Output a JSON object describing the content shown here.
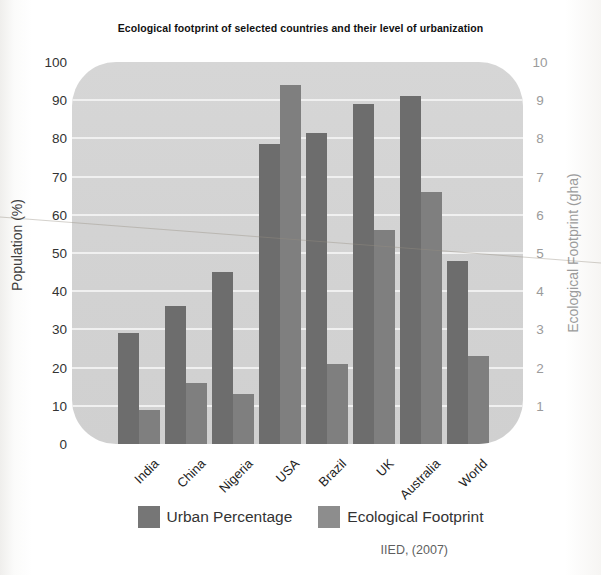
{
  "title": "Ecological  footprint of selected countries and their level of urbanization",
  "source": "IIED, (2007)",
  "left_axis": {
    "label": "Population (%)",
    "ticks": [
      0,
      10,
      20,
      30,
      40,
      50,
      60,
      70,
      80,
      90,
      100
    ],
    "min": 0,
    "max": 100
  },
  "right_axis": {
    "label": "Ecological Footprint (gha)",
    "ticks": [
      1,
      2,
      3,
      4,
      5,
      6,
      7,
      8,
      9,
      10
    ],
    "min": 0,
    "max": 10
  },
  "legend": [
    {
      "label": "Urban Percentage",
      "color": "#767676"
    },
    {
      "label": "Ecological Footprint",
      "color": "#8d8d8d"
    }
  ],
  "colors": {
    "urban_bar": "#6d6d6d",
    "footprint_bar": "#7f7f7f",
    "plot_background": "#d3d3d3",
    "gridline": "#f0f0f0",
    "left_axis_text": "#333333",
    "right_axis_text": "#9b9b9b"
  },
  "chart_data": {
    "type": "bar",
    "title": "Ecological footprint of selected countries and their level of urbanization",
    "categories": [
      "India",
      "China",
      "Nigeria",
      "USA",
      "Brazil",
      "UK",
      "Australia",
      "World"
    ],
    "series": [
      {
        "name": "Urban Percentage",
        "axis": "left",
        "unit": "%",
        "values": [
          29,
          36,
          45,
          78.5,
          81.5,
          89,
          91,
          48
        ]
      },
      {
        "name": "Ecological Footprint",
        "axis": "right",
        "unit": "gha",
        "values": [
          0.9,
          1.6,
          1.3,
          9.4,
          2.1,
          5.6,
          6.6,
          2.3
        ]
      }
    ],
    "left_ylim": [
      0,
      100
    ],
    "right_ylim": [
      0,
      10
    ],
    "grid": "horizontal-white-lines",
    "legend_position": "bottom",
    "source": "IIED, (2007)"
  }
}
